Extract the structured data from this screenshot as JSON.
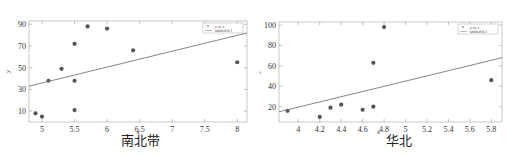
{
  "chart_data": [
    {
      "type": "scatter",
      "title": "南北带",
      "xlabel": "x",
      "ylabel": "y",
      "xlim": [
        4.8,
        8.15
      ],
      "ylim": [
        0,
        93
      ],
      "xticks": [
        5,
        5.5,
        6,
        6.5,
        7,
        7.5,
        8
      ],
      "xtick_labels": [
        "5",
        "5.5",
        "6",
        "6.5",
        "7",
        "7.5",
        "8"
      ],
      "yticks": [
        10,
        30,
        50,
        70,
        90
      ],
      "ytick_labels": [
        "10",
        "30",
        "50",
        "70",
        "90"
      ],
      "grid": false,
      "legend_position": "upper right",
      "legend": [
        "y vs. x",
        "untitled fit 1"
      ],
      "series": [
        {
          "name": "y vs. x",
          "kind": "points",
          "x": [
            4.9,
            5.0,
            5.1,
            5.3,
            5.5,
            5.5,
            5.5,
            5.7,
            6.0,
            6.4,
            8.0
          ],
          "y": [
            8,
            5,
            38,
            49,
            72,
            38,
            11,
            88,
            86,
            66,
            55
          ]
        },
        {
          "name": "untitled fit 1",
          "kind": "line",
          "x": [
            4.8,
            8.15
          ],
          "y": [
            33,
            82
          ]
        }
      ]
    },
    {
      "type": "scatter",
      "title": "华北",
      "xlabel": "x",
      "ylabel": "y",
      "xlim": [
        3.82,
        5.9
      ],
      "ylim": [
        5,
        103
      ],
      "xticks": [
        4,
        4.2,
        4.4,
        4.6,
        4.8,
        5,
        5.2,
        5.4,
        5.6,
        5.8
      ],
      "xtick_labels": [
        "4",
        "4.2",
        "4.4",
        "4.6",
        "4.8",
        "5",
        "5.2",
        "5.4",
        "5.6",
        "5.8"
      ],
      "yticks": [
        20,
        40,
        60,
        80,
        100
      ],
      "ytick_labels": [
        "20",
        "40",
        "60",
        "80",
        "100"
      ],
      "grid": false,
      "legend_position": "upper right",
      "legend": [
        "y vs. x",
        "untitled fit 1"
      ],
      "series": [
        {
          "name": "y vs. x",
          "kind": "points",
          "x": [
            3.9,
            4.2,
            4.3,
            4.4,
            4.6,
            4.7,
            4.7,
            4.8,
            5.8
          ],
          "y": [
            16,
            10,
            19,
            22,
            17,
            20,
            63,
            98,
            46
          ]
        },
        {
          "name": "untitled fit 1",
          "kind": "line",
          "x": [
            3.82,
            5.9
          ],
          "y": [
            15,
            68
          ]
        }
      ]
    }
  ]
}
